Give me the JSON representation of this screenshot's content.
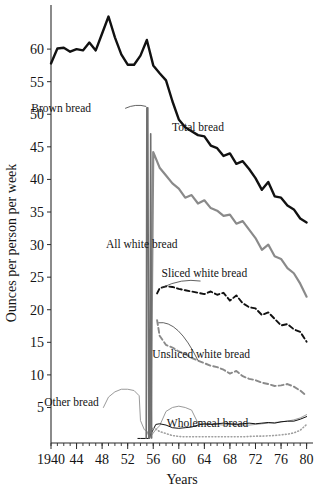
{
  "chart_data": {
    "type": "line",
    "title": "",
    "xlabel": "Years",
    "ylabel": "Ounces per person per week",
    "xlim": [
      1940,
      1981
    ],
    "ylim": [
      0,
      66
    ],
    "grid": false,
    "legend_position": "inline-labels",
    "x_ticks": [
      1940,
      1944,
      1948,
      1952,
      1956,
      1960,
      1964,
      1968,
      1972,
      1976,
      1980
    ],
    "x_tick_labels": [
      "1940",
      "44",
      "48",
      "52",
      "56",
      "60",
      "64",
      "68",
      "72",
      "76",
      "80"
    ],
    "x_minor_tick_step": 1,
    "y_ticks": [
      5,
      10,
      15,
      20,
      25,
      30,
      35,
      40,
      45,
      50,
      55,
      60
    ],
    "y_tick_labels": [
      "5",
      "10",
      "15",
      "20",
      "25",
      "30",
      "35",
      "40",
      "45",
      "50",
      "55",
      "60"
    ],
    "series": [
      {
        "name": "Total bread",
        "label": "Total bread",
        "color": "#111111",
        "style": "solid",
        "width": 2.4,
        "label_x": 1963,
        "label_y": 47.5,
        "x": [
          1940,
          1941,
          1942,
          1943,
          1944,
          1945,
          1946,
          1947,
          1948,
          1949,
          1950,
          1951,
          1952,
          1953,
          1954,
          1955,
          1956,
          1957,
          1958,
          1959,
          1960,
          1961,
          1962,
          1963,
          1964,
          1965,
          1966,
          1967,
          1968,
          1969,
          1970,
          1971,
          1972,
          1973,
          1974,
          1975,
          1976,
          1977,
          1978,
          1979,
          1980
        ],
        "y": [
          57.8,
          60.1,
          60.2,
          59.6,
          60.0,
          59.8,
          61.0,
          59.8,
          62.4,
          65.0,
          61.8,
          59.2,
          57.6,
          57.6,
          59.0,
          61.4,
          57.5,
          56.3,
          55.2,
          52.0,
          49.2,
          48.0,
          47.4,
          46.8,
          46.6,
          45.2,
          44.8,
          43.6,
          44.0,
          42.4,
          42.8,
          41.6,
          40.2,
          38.4,
          39.6,
          37.4,
          37.2,
          36.0,
          35.4,
          34.0,
          33.4
        ]
      },
      {
        "name": "All white bread",
        "label": "All white bread",
        "color": "#8a8a8a",
        "style": "solid",
        "width": 2.2,
        "label_x": 1954.2,
        "label_y": 29.4,
        "x": [
          1955.6,
          1956,
          1957,
          1958,
          1959,
          1960,
          1961,
          1962,
          1963,
          1964,
          1965,
          1966,
          1967,
          1968,
          1969,
          1970,
          1971,
          1972,
          1973,
          1974,
          1975,
          1976,
          1977,
          1978,
          1979,
          1980
        ],
        "y": [
          1.0,
          44.2,
          41.8,
          40.6,
          39.4,
          38.6,
          37.2,
          37.6,
          36.3,
          36.8,
          35.6,
          35.2,
          34.4,
          34.6,
          33.2,
          33.6,
          32.3,
          31.0,
          29.2,
          30.0,
          28.2,
          27.8,
          26.4,
          25.6,
          24.0,
          22.0
        ]
      },
      {
        "name": "Sliced white bread",
        "label": "Sliced white bread",
        "color": "#111111",
        "style": "dashed",
        "width": 1.9,
        "label_x": 1964,
        "label_y": 25.0,
        "x": [
          1956.6,
          1957,
          1958,
          1959,
          1960,
          1961,
          1962,
          1963,
          1964,
          1965,
          1966,
          1967,
          1968,
          1969,
          1970,
          1971,
          1972,
          1973,
          1974,
          1975,
          1976,
          1977,
          1978,
          1979,
          1980
        ],
        "y": [
          22.5,
          23.3,
          23.6,
          23.5,
          23.2,
          23.0,
          22.8,
          22.6,
          22.4,
          22.8,
          22.3,
          22.6,
          21.4,
          22.2,
          21.0,
          20.4,
          20.2,
          19.2,
          19.6,
          18.6,
          17.6,
          17.8,
          17.0,
          16.6,
          15.1
        ]
      },
      {
        "name": "Unsliced white bread",
        "label": "Unsliced white bread",
        "color": "#8a8a8a",
        "style": "dashed",
        "width": 1.9,
        "label_x": 1963.5,
        "label_y": 12.6,
        "x": [
          1956.6,
          1957,
          1958,
          1959,
          1960,
          1961,
          1962,
          1963,
          1964,
          1965,
          1966,
          1967,
          1968,
          1969,
          1970,
          1971,
          1972,
          1973,
          1974,
          1975,
          1976,
          1977,
          1978,
          1979,
          1980
        ],
        "y": [
          18.4,
          16.0,
          14.6,
          14.2,
          13.6,
          13.2,
          12.6,
          12.2,
          11.8,
          11.4,
          11.2,
          10.8,
          10.2,
          10.6,
          9.8,
          9.4,
          9.2,
          8.8,
          8.6,
          8.3,
          8.4,
          8.6,
          8.2,
          7.6,
          6.8
        ]
      },
      {
        "name": "Other bread",
        "label": "Other bread",
        "color": "#9a9a9a",
        "style": "solid",
        "width": 1.0,
        "label_x": 1943.2,
        "label_y": 5.2,
        "x": [
          1948.2,
          1949,
          1950,
          1951,
          1952,
          1953,
          1953.8,
          1954,
          1954.6,
          1955,
          1955.4,
          1956.4,
          1957,
          1958,
          1959,
          1960,
          1961,
          1962,
          1963,
          1964,
          1965,
          1966,
          1967,
          1968,
          1969,
          1970,
          1971,
          1972,
          1973,
          1974,
          1975,
          1976,
          1977,
          1978,
          1979,
          1980
        ],
        "y": [
          5.0,
          6.6,
          7.4,
          7.8,
          7.8,
          7.6,
          6.8,
          3.0,
          1.6,
          1.4,
          0.3,
          1.6,
          2.2,
          4.4,
          5.0,
          5.2,
          5.0,
          4.6,
          2.6,
          2.4,
          2.4,
          2.4,
          2.3,
          2.4,
          2.3,
          2.3,
          2.3,
          2.4,
          2.5,
          2.6,
          2.7,
          2.8,
          2.9,
          3.1,
          3.4,
          3.9
        ]
      },
      {
        "name": "Wholemeal bread",
        "label": "Wholemeal bread",
        "color": "#111111",
        "style": "solid",
        "width": 1.0,
        "label_x": 1964.5,
        "label_y": 2.0,
        "x": [
          1953.6,
          1954,
          1954.8,
          1955.3,
          1956.4,
          1957,
          1958,
          1959,
          1960,
          1961,
          1962,
          1963,
          1964,
          1965,
          1966,
          1967,
          1968,
          1969,
          1970,
          1971,
          1972,
          1973,
          1974,
          1975,
          1976,
          1977,
          1978,
          1979,
          1980
        ],
        "y": [
          0.25,
          0.25,
          0.25,
          0.25,
          2.4,
          2.5,
          2.3,
          1.9,
          1.8,
          1.9,
          2.0,
          2.3,
          2.5,
          2.4,
          2.5,
          2.6,
          2.5,
          2.4,
          2.5,
          2.6,
          2.5,
          2.6,
          2.7,
          2.6,
          2.8,
          2.9,
          2.9,
          3.2,
          3.6
        ]
      },
      {
        "name": "Wholemeal bread dotted",
        "label": "",
        "color": "#a0a0a0",
        "style": "dotted",
        "width": 1.6,
        "label_x": null,
        "label_y": null,
        "x": [
          1955.4,
          1956.4,
          1957,
          1958,
          1959,
          1960,
          1961,
          1962,
          1963,
          1964,
          1965,
          1966,
          1967,
          1968,
          1969,
          1970,
          1971,
          1972,
          1973,
          1974,
          1975,
          1976,
          1977,
          1978,
          1979,
          1980
        ],
        "y": [
          1.8,
          1.7,
          1.3,
          1.0,
          0.7,
          0.55,
          0.5,
          0.5,
          0.5,
          0.5,
          0.5,
          0.5,
          0.5,
          0.5,
          0.5,
          0.5,
          0.55,
          0.6,
          0.6,
          0.65,
          0.7,
          0.8,
          0.9,
          1.1,
          1.5,
          2.4
        ]
      },
      {
        "name": "Brown bread",
        "label": "Brown bread",
        "color": "#6f6f6f",
        "style": "solid",
        "width": 1.6,
        "label_x": 1941.6,
        "label_y": 50.4,
        "x": [
          1954.9,
          1955.0,
          1955.15,
          1955.3,
          1955.45,
          1955.6,
          1955.75
        ],
        "y": [
          0.3,
          51.0,
          51.0,
          0.3,
          0.3,
          47.0,
          0.3
        ]
      }
    ],
    "annotations": [
      {
        "name": "brown-bread-leader",
        "from_x": 1951.6,
        "from_y": 50.9,
        "to_x": 1954.9,
        "to_y": 51.2
      },
      {
        "name": "sliced-white-leader",
        "from_x": 1957.4,
        "from_y": 23.4,
        "to_x": 1963.4,
        "to_y": 24.4
      },
      {
        "name": "unsliced-white-leader",
        "from_x": 1956.8,
        "from_y": 18.0,
        "to_x": 1963.0,
        "to_y": 12.2
      }
    ]
  }
}
